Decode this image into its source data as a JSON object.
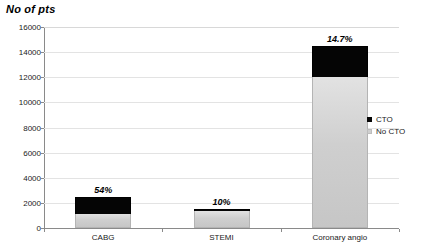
{
  "chart_data": {
    "type": "bar",
    "subtype": "stacked",
    "title": "No of pts",
    "xlabel": "",
    "ylabel": "No of pts",
    "categories": [
      "CABG",
      "STEMI",
      "Coronary angio"
    ],
    "series": [
      {
        "name": "No CTO",
        "color": "#cfcfcf",
        "values": [
          1150,
          1360,
          12000
        ]
      },
      {
        "name": "CTO",
        "color": "#060606",
        "values": [
          1350,
          150,
          2450
        ]
      }
    ],
    "totals": [
      2500,
      1510,
      14450
    ],
    "annotations": [
      "54%",
      "10%",
      "14.7%"
    ],
    "ylim": [
      0,
      16000
    ],
    "yticks": [
      0,
      2000,
      4000,
      6000,
      8000,
      10000,
      12000,
      14000,
      16000
    ],
    "ytick_labels": [
      "0",
      "2000",
      "4000",
      "6000",
      "8000",
      "10000",
      "12000",
      "14000",
      "16000"
    ],
    "grid": true,
    "legend_position": "right",
    "legend_entries": [
      "CTO",
      "No CTO"
    ]
  },
  "legend": {
    "items": [
      {
        "label": "CTO",
        "swatch": "black-square-icon"
      },
      {
        "label": "No CTO",
        "swatch": "gray-square-icon"
      }
    ]
  }
}
